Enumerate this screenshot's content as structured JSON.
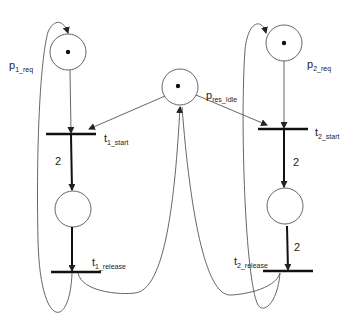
{
  "diagram": {
    "type": "petri-net",
    "places": [
      {
        "id": "p1_req",
        "label": "p",
        "sub": "1_req",
        "tokens": 1
      },
      {
        "id": "p_res_idle",
        "label": "p",
        "sub": "res_Idle",
        "tokens": 1
      },
      {
        "id": "p2_req",
        "label": "p",
        "sub": "2_req",
        "tokens": 1
      },
      {
        "id": "p1_mid",
        "label": "",
        "sub": "",
        "tokens": 0
      },
      {
        "id": "p2_mid",
        "label": "",
        "sub": "",
        "tokens": 0
      }
    ],
    "transitions": [
      {
        "id": "t1_start",
        "label": "t",
        "sub": "1_start"
      },
      {
        "id": "t1_release",
        "label": "t",
        "sub": "1_release"
      },
      {
        "id": "t2_start",
        "label": "t",
        "sub": "2_start"
      },
      {
        "id": "t2_release",
        "label": "t",
        "sub": "2_release"
      }
    ],
    "arc_weights": {
      "t1_start_to_p1_mid": "2",
      "p1_mid_to_t1_release": "2",
      "t2_start_to_p2_mid": "2",
      "p2_mid_to_t2_release": "2"
    }
  }
}
